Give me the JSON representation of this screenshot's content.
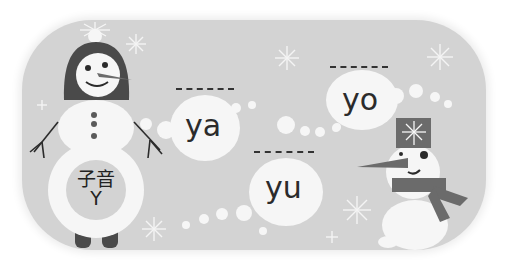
{
  "scene": {
    "type": "educational-illustration",
    "background_color": "#d3d3d3"
  },
  "left_snowman": {
    "belly_label_line1": "子音",
    "belly_label_line2": "Y"
  },
  "bubbles": [
    {
      "text": "ya"
    },
    {
      "text": "yo"
    },
    {
      "text": "yu"
    }
  ],
  "colors": {
    "panel": "#d3d3d3",
    "snow": "#f6f6f6",
    "dark": "#4a4a4a",
    "text": "#2b2b2b"
  }
}
